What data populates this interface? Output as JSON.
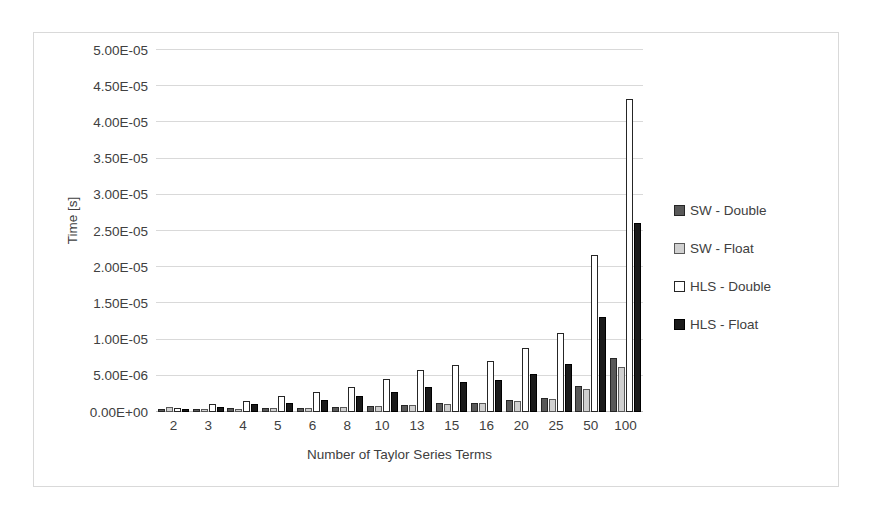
{
  "chart_data": {
    "type": "bar",
    "title": "",
    "subtitle": "",
    "xlabel": "Number of Taylor Series Terms",
    "ylabel": "Time [s]",
    "categories": [
      "2",
      "3",
      "4",
      "5",
      "6",
      "8",
      "10",
      "13",
      "15",
      "16",
      "20",
      "25",
      "50",
      "100"
    ],
    "ylim": [
      0,
      5e-05
    ],
    "ytick_values": [
      0,
      5e-06,
      1e-05,
      1.5e-05,
      2e-05,
      2.5e-05,
      3e-05,
      3.5e-05,
      4e-05,
      4.5e-05,
      5e-05
    ],
    "ytick_labels": [
      "0.00E+00",
      "5.00E-06",
      "1.00E-05",
      "1.50E-05",
      "2.00E-05",
      "2.50E-05",
      "3.00E-05",
      "3.50E-05",
      "4.00E-05",
      "4.50E-05",
      "5.00E-05"
    ],
    "grid": true,
    "legend_position": "right",
    "series": [
      {
        "name": "SW - Double",
        "color": "#595959",
        "values": [
          4e-07,
          4.5e-07,
          5e-07,
          5.5e-07,
          6e-07,
          7e-07,
          8.5e-07,
          1e-06,
          1.2e-06,
          1.3e-06,
          1.6e-06,
          1.9e-06,
          3.6e-06,
          7.5e-06
        ]
      },
      {
        "name": "SW - Float",
        "color": "#d0d0d0",
        "values": [
          6.5e-07,
          4e-07,
          4.5e-07,
          5e-07,
          5.5e-07,
          6.5e-07,
          8e-07,
          9.5e-07,
          1.1e-06,
          1.2e-06,
          1.5e-06,
          1.8e-06,
          3.2e-06,
          6.2e-06
        ]
      },
      {
        "name": "HLS - Double",
        "color": "#ffffff",
        "values": [
          5e-07,
          1.1e-06,
          1.5e-06,
          2.2e-06,
          2.7e-06,
          3.5e-06,
          4.6e-06,
          5.8e-06,
          6.5e-06,
          7e-06,
          8.8e-06,
          1.09e-05,
          2.17e-05,
          4.32e-05
        ]
      },
      {
        "name": "HLS - Float",
        "color": "#1a1a1a",
        "values": [
          4.5e-07,
          7.5e-07,
          1.1e-06,
          1.3e-06,
          1.6e-06,
          2.2e-06,
          2.8e-06,
          3.5e-06,
          4.1e-06,
          4.4e-06,
          5.2e-06,
          6.6e-06,
          1.31e-05,
          2.61e-05
        ]
      }
    ]
  },
  "legend": {
    "entries": [
      {
        "label": "SW - Double",
        "swatch": "sw-double"
      },
      {
        "label": "SW - Float",
        "swatch": "sw-float"
      },
      {
        "label": "HLS - Double",
        "swatch": "hls-double"
      },
      {
        "label": "HLS - Float",
        "swatch": "hls-float"
      }
    ]
  }
}
